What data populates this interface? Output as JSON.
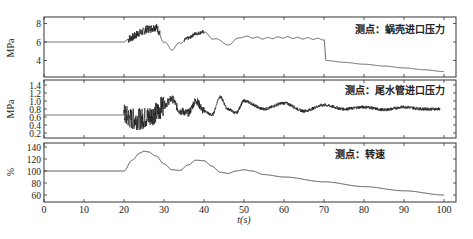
{
  "chart_data": [
    {
      "type": "line",
      "title": "测点：蜗壳进口压力",
      "xlabel": "t(s)",
      "ylabel": "MPa",
      "xlim": [
        0,
        100
      ],
      "ylim": [
        2.5,
        9
      ],
      "yticks": [
        4,
        6,
        8
      ],
      "grid": false,
      "x": [
        0,
        20,
        22,
        24,
        26,
        28,
        30,
        32,
        34,
        36,
        38,
        40,
        42,
        44,
        46,
        48,
        50,
        52,
        55,
        60,
        65,
        70,
        70.5,
        75,
        80,
        85,
        90,
        95,
        100
      ],
      "values": [
        6.0,
        6.0,
        6.5,
        7.0,
        7.4,
        7.6,
        6.0,
        5.2,
        5.9,
        6.4,
        6.9,
        7.1,
        6.4,
        6.2,
        5.6,
        6.3,
        6.6,
        6.5,
        6.4,
        6.5,
        6.4,
        6.3,
        4.0,
        3.8,
        3.6,
        3.4,
        3.2,
        3.0,
        2.8
      ],
      "annotations": [
        "strong high-frequency oscillation between t=21 and t=29 and near t=36-40",
        "sharp drop at t≈70.5"
      ]
    },
    {
      "type": "line",
      "title": "测点：尾水管进口压力",
      "xlabel": "t(s)",
      "ylabel": "MPa",
      "xlim": [
        0,
        100
      ],
      "ylim": [
        0.1,
        1.5
      ],
      "yticks": [
        0.2,
        0.4,
        0.6,
        0.8,
        1.0,
        1.2,
        1.4
      ],
      "grid": false,
      "x": [
        0,
        20,
        22,
        24,
        26,
        28,
        30,
        32,
        34,
        36,
        38,
        40,
        42,
        44,
        46,
        48,
        50,
        55,
        60,
        65,
        70,
        75,
        80,
        85,
        90,
        95,
        99
      ],
      "values": [
        0.65,
        0.65,
        0.55,
        0.55,
        0.6,
        0.7,
        0.9,
        1.05,
        0.75,
        0.7,
        1.0,
        0.75,
        0.65,
        1.1,
        0.8,
        0.7,
        1.0,
        0.8,
        0.95,
        0.75,
        0.9,
        0.8,
        0.85,
        0.78,
        0.85,
        0.8,
        0.8
      ],
      "annotations": [
        "high-frequency noise band 20-30 s",
        "damped oscillations ~5 s period from 30 s onward"
      ]
    },
    {
      "type": "line",
      "title": "测点：转速",
      "xlabel": "t(s)",
      "ylabel": "%",
      "xlim": [
        0,
        100
      ],
      "ylim": [
        50,
        145
      ],
      "yticks": [
        60,
        80,
        100,
        120,
        140
      ],
      "xticks": [
        0,
        10,
        20,
        30,
        40,
        50,
        60,
        70,
        80,
        90,
        100
      ],
      "grid": false,
      "x": [
        0,
        20,
        22,
        24,
        25,
        26,
        28,
        30,
        32,
        34,
        36,
        38,
        40,
        42,
        44,
        46,
        48,
        50,
        52,
        55,
        60,
        70,
        80,
        90,
        100
      ],
      "values": [
        100,
        100,
        118,
        130,
        133,
        132,
        125,
        112,
        102,
        101,
        110,
        118,
        117,
        108,
        98,
        96,
        100,
        102,
        100,
        94,
        90,
        82,
        74,
        67,
        60
      ]
    }
  ],
  "panels": [
    {
      "label": "测点：蜗壳进口压力",
      "ylabel": "MPa",
      "yticks": [
        "8",
        "6",
        "4"
      ]
    },
    {
      "label": "测点：尾水管进口压力",
      "ylabel": "MPa",
      "yticks": [
        "1.4",
        "1.2",
        "1.0",
        "0.8",
        "0.6",
        "0.4",
        "0.2"
      ]
    },
    {
      "label": "测点：转速",
      "ylabel": "%",
      "yticks": [
        "140",
        "120",
        "100",
        "80",
        "60"
      ]
    }
  ],
  "xaxis": {
    "label": "t(s)",
    "ticks": [
      "0",
      "10",
      "20",
      "30",
      "40",
      "50",
      "60",
      "70",
      "80",
      "90",
      "100"
    ]
  }
}
